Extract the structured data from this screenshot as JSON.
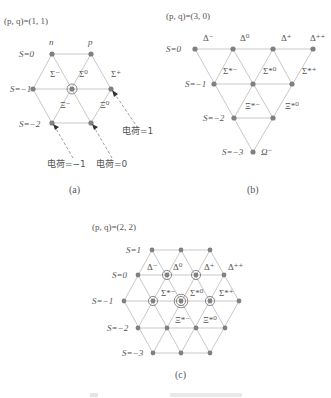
{
  "diagram_a": {
    "title": "(p, q)=(1, 1)",
    "caption": "(a)",
    "strangeness_labels": [
      "S=0",
      "S=−1",
      "S=−2"
    ],
    "top_labels": [
      "n",
      "p"
    ],
    "particles": [
      "Σ⁻",
      "Σ⁰",
      "Σ⁺",
      "Ξ⁻",
      "Ξ⁰"
    ],
    "charge_labels": [
      "电荷=1",
      "电荷=−1",
      "电荷=0"
    ]
  },
  "diagram_b": {
    "title": "(p, q)=(3, 0)",
    "caption": "(b)",
    "strangeness_labels": [
      "S=0",
      "S=−1",
      "S=−2",
      "S=−3"
    ],
    "delta_labels": [
      "Δ⁻",
      "Δ⁰",
      "Δ⁺",
      "Δ⁺⁺"
    ],
    "sigma_labels": [
      "Σ*⁻",
      "Σ*⁰",
      "Σ*⁺"
    ],
    "xi_labels": [
      "Ξ*⁻",
      "Ξ*⁰"
    ],
    "omega_label": "Ω⁻"
  },
  "diagram_c": {
    "title": "(p, q)=(2, 2)",
    "caption": "(c)",
    "strangeness_labels": [
      "S=1",
      "S=0",
      "S=−1",
      "S=−2",
      "S=−3"
    ],
    "delta_labels": [
      "Δ⁻",
      "Δ⁰",
      "Δ⁺",
      "Δ⁺⁺"
    ],
    "sigma_labels": [
      "Σ*⁻",
      "Σ*⁰",
      "Σ*⁺"
    ],
    "xi_labels": [
      "Ξ*⁻",
      "Ξ*⁰"
    ]
  },
  "colors": {
    "node": "#808080",
    "edge": "#c9c9c9",
    "text": "#555555"
  }
}
